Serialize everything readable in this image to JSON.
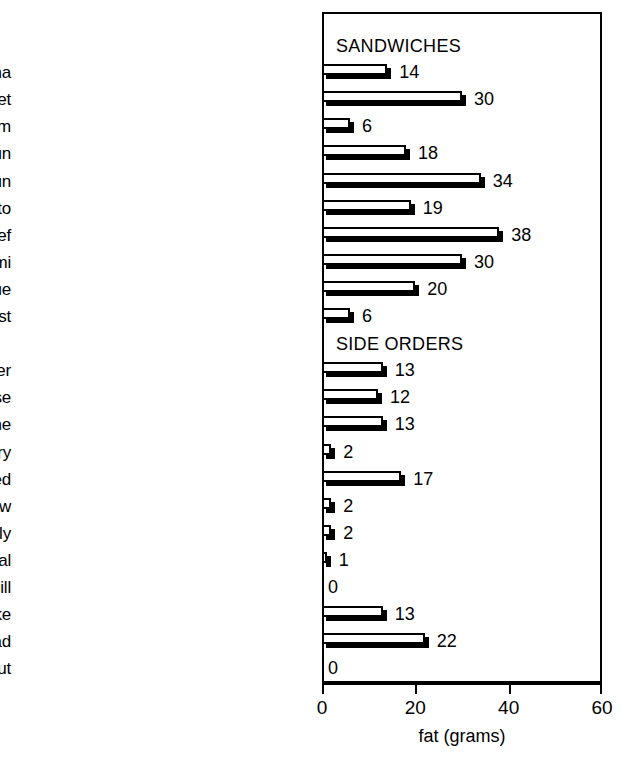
{
  "chart_data": {
    "type": "bar",
    "orientation": "horizontal",
    "title": "",
    "xlabel": "fat (grams)",
    "ylabel": "",
    "xlim": [
      0,
      60
    ],
    "xticks": [
      0,
      20,
      40,
      60
    ],
    "xtick_labels": [
      "0",
      "20",
      "40",
      "60"
    ],
    "grid": false,
    "legend": false,
    "value_labels": true,
    "frame": true,
    "groups": [
      {
        "name": "SANDWICHES",
        "categories": [
          "Bologna",
          "Brisket",
          "Ham",
          "Hot dog w/bun",
          "Knockwurst w/bun",
          "Lox, bagel, cream ch, tomato",
          "Roast Beef",
          "Salami",
          "Tongue",
          "Turkey breast"
        ],
        "values": [
          14,
          30,
          6,
          18,
          34,
          19,
          38,
          30,
          20,
          6
        ]
      },
      {
        "name": "SIDE ORDERS",
        "categories": [
          "Bagel w/butter",
          "Bagel w/cream cheese",
          "Bagel w/margarine",
          "Bagel, dry",
          "Chicken liver, chopped",
          "Cole slaw",
          "Gefilte fish, jelly",
          "Gefilte fish, natural",
          "Pickle, dill",
          "Potato pancake",
          "Potato salad",
          "Sauerkraut"
        ],
        "values": [
          13,
          12,
          13,
          2,
          17,
          2,
          2,
          1,
          0,
          13,
          22,
          0
        ]
      }
    ],
    "colors": {
      "bar_face": "#ffffff",
      "bar_edge": "#000000",
      "bar_shadow": "#000000",
      "text": "#000000",
      "background": "#ffffff"
    }
  }
}
